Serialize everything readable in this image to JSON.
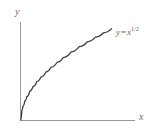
{
  "figure": {
    "background_color": "#ffffff",
    "axis_color": "#9a9a9a",
    "curve_color": "#3a3a3a",
    "label_color": "#6a6a6a"
  },
  "axes": {
    "y_label": "y",
    "x_label": "x"
  },
  "annotation": {
    "equation_lhs": "y",
    "equation_operator": "=",
    "equation_base": "x",
    "equation_exponent": "1/2",
    "equation_full": "y = x^(1/2)"
  },
  "chart_data": {
    "type": "line",
    "title": "",
    "subtitle": "",
    "xlabel": "x",
    "ylabel": "y",
    "xlim": [
      0,
      10
    ],
    "ylim": [
      0,
      3.2
    ],
    "grid": false,
    "legend": false,
    "legend_position": "none",
    "annotations": [
      {
        "text": "y = x^(1/2)",
        "x": 9.2,
        "y": 3.03,
        "placement": "end-of-curve-upper-right"
      }
    ],
    "series": [
      {
        "name": "y = x^(1/2)",
        "equation": "y = x^(1/2)",
        "color": "#3a3a3a",
        "x": [
          0,
          0.1,
          0.2,
          0.4,
          0.6,
          0.9,
          1.2,
          1.6,
          2,
          2.5,
          3,
          3.6,
          4.2,
          5,
          5.8,
          6.6,
          7.4,
          8.2,
          9
        ],
        "values": [
          0,
          0.316,
          0.447,
          0.632,
          0.775,
          0.949,
          1.095,
          1.265,
          1.414,
          1.581,
          1.732,
          1.897,
          2.049,
          2.236,
          2.408,
          2.569,
          2.72,
          2.864,
          3.0
        ]
      }
    ],
    "tick_labels_x": [],
    "tick_labels_y": []
  }
}
